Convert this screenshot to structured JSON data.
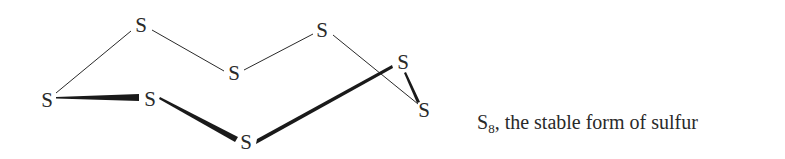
{
  "diagram": {
    "atoms": [
      {
        "id": "s1",
        "label": "S",
        "x": 141,
        "y": 25
      },
      {
        "id": "s2",
        "label": "S",
        "x": 322,
        "y": 30
      },
      {
        "id": "s3",
        "label": "S",
        "x": 234,
        "y": 73
      },
      {
        "id": "s4",
        "label": "S",
        "x": 47,
        "y": 100
      },
      {
        "id": "s5",
        "label": "S",
        "x": 150,
        "y": 99
      },
      {
        "id": "s6",
        "label": "S",
        "x": 246,
        "y": 142
      },
      {
        "id": "s7",
        "label": "S",
        "x": 403,
        "y": 62
      },
      {
        "id": "s8",
        "label": "S",
        "x": 424,
        "y": 110
      }
    ],
    "bonds": [
      {
        "from": "s4",
        "to": "s1",
        "style": "thin"
      },
      {
        "from": "s1",
        "to": "s3",
        "style": "thin"
      },
      {
        "from": "s3",
        "to": "s2",
        "style": "thin"
      },
      {
        "from": "s2",
        "to": "s8",
        "style": "thin"
      },
      {
        "from": "s4",
        "to": "s5",
        "style": "wedge"
      },
      {
        "from": "s5",
        "to": "s6",
        "style": "wedge"
      },
      {
        "from": "s6",
        "to": "s7",
        "style": "wedge"
      },
      {
        "from": "s7",
        "to": "s8",
        "style": "wedge"
      }
    ],
    "colors": {
      "ink": "#2a2a2a",
      "background": "#ffffff"
    }
  },
  "caption": {
    "symbol": "S",
    "subscript": "8",
    "text": ", the stable form of sulfur"
  }
}
